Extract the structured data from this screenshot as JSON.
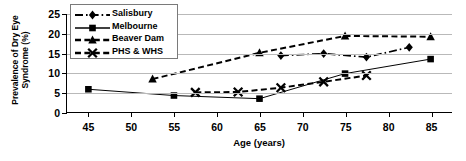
{
  "chart_data": {
    "type": "line",
    "title": "",
    "xlabel": "Age (years)",
    "ylabel": "Prevalence of Dry Eye Syndrome (%)",
    "ylabel_line1": "Prevalence of Dry Eye",
    "ylabel_line2": "Syndrome (%)",
    "xlim": [
      42.5,
      87.5
    ],
    "ylim": [
      0,
      25
    ],
    "xticks": [
      45,
      50,
      55,
      60,
      65,
      70,
      75,
      80,
      85
    ],
    "yticks": [
      0,
      5,
      10,
      15,
      20,
      25
    ],
    "grid": true,
    "grid_axis": "y",
    "legend_position": "upper-left-inside",
    "series": [
      {
        "name": "Salisbury",
        "marker": "diamond",
        "linestyle": "dash-dot",
        "color": "#000000",
        "x": [
          67.5,
          72.5,
          77.5,
          82.5
        ],
        "values": [
          14.4,
          14.9,
          14.0,
          16.5
        ]
      },
      {
        "name": "Melbourne",
        "marker": "square",
        "linestyle": "solid",
        "color": "#000000",
        "x": [
          45,
          55,
          65,
          75,
          85
        ],
        "values": [
          5.8,
          4.2,
          3.4,
          9.8,
          13.5
        ]
      },
      {
        "name": "Beaver Dam",
        "marker": "triangle",
        "linestyle": "dashed",
        "color": "#000000",
        "x": [
          52.5,
          65,
          75,
          85
        ],
        "values": [
          8.4,
          15.1,
          19.4,
          19.2
        ]
      },
      {
        "name": "PHS & WHS",
        "marker": "x",
        "linestyle": "dashed",
        "color": "#000000",
        "x": [
          57.5,
          62.5,
          67.5,
          72.5,
          77.5
        ],
        "values": [
          5.0,
          5.1,
          6.2,
          7.7,
          9.3
        ]
      }
    ]
  },
  "legend": {
    "items": [
      {
        "label": "Salisbury"
      },
      {
        "label": "Melbourne"
      },
      {
        "label": "Beaver Dam"
      },
      {
        "label": "PHS & WHS"
      }
    ]
  }
}
